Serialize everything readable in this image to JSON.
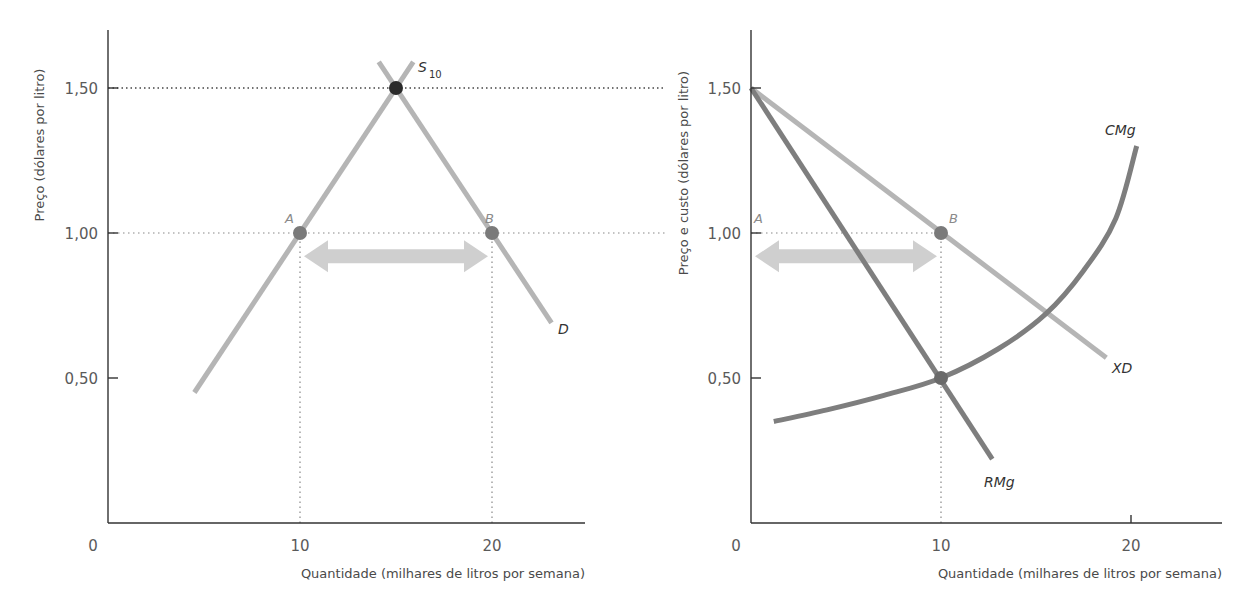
{
  "chart_data": [
    {
      "type": "line",
      "title": "",
      "xlabel": "Quantidade (milhares de litros por semana)",
      "ylabel": "Preço (dólares por litro)",
      "xlim": [
        0,
        25
      ],
      "ylim": [
        0,
        1.7
      ],
      "x_ticks": [
        {
          "value": 0,
          "label": "0"
        },
        {
          "value": 10,
          "label": "10"
        },
        {
          "value": 20,
          "label": "20"
        }
      ],
      "y_ticks": [
        {
          "value": 0.5,
          "label": "0,50"
        },
        {
          "value": 1.0,
          "label": "1,00"
        },
        {
          "value": 1.5,
          "label": "1,50"
        }
      ],
      "grid": false,
      "series": [
        {
          "name": "S10",
          "label_main": "S",
          "label_sub": "10",
          "color": "#b5b5b5",
          "points": [
            [
              4.5,
              0.45
            ],
            [
              15.9,
              1.59
            ]
          ]
        },
        {
          "name": "D",
          "label_main": "D",
          "label_sub": "",
          "color": "#b5b5b5",
          "points": [
            [
              14.1,
              1.59
            ],
            [
              23.1,
              0.69
            ]
          ]
        }
      ],
      "points": [
        {
          "name": "equilibrium",
          "label": "",
          "x": 15,
          "y": 1.5,
          "color": "#2a2a2a"
        },
        {
          "name": "A",
          "label": "A",
          "x": 10,
          "y": 1.0,
          "color": "#7a7a7a"
        },
        {
          "name": "B",
          "label": "B",
          "x": 20,
          "y": 1.0,
          "color": "#7a7a7a"
        }
      ],
      "reference_lines": [
        {
          "type": "horizontal",
          "y": 1.5,
          "from_x": 0,
          "to_x": 29
        },
        {
          "type": "horizontal",
          "y": 1.0,
          "from_x": 0,
          "to_x": 29
        },
        {
          "type": "vertical",
          "x": 10,
          "from_y": 0,
          "to_y": 1.0
        },
        {
          "type": "vertical",
          "x": 20,
          "from_y": 0,
          "to_y": 1.0
        }
      ],
      "annotations": [
        {
          "type": "double-arrow",
          "from": [
            10,
            0.93
          ],
          "to": [
            20,
            0.93
          ],
          "meaning": "excess supply between A and B"
        }
      ]
    },
    {
      "type": "line",
      "title": "",
      "xlabel": "Quantidade (milhares de litros por semana)",
      "ylabel": "Preço e custo (dólares por litro)",
      "xlim": [
        0,
        24.5
      ],
      "ylim": [
        0,
        1.7
      ],
      "x_ticks": [
        {
          "value": 0,
          "label": "0"
        },
        {
          "value": 10,
          "label": "10"
        },
        {
          "value": 20,
          "label": "20"
        }
      ],
      "y_ticks": [
        {
          "value": 0.5,
          "label": "0,50"
        },
        {
          "value": 1.0,
          "label": "1,00"
        },
        {
          "value": 1.5,
          "label": "1,50"
        }
      ],
      "grid": false,
      "series": [
        {
          "name": "XD",
          "label_main": "XD",
          "color": "#b5b5b5",
          "points": [
            [
              0,
              1.5
            ],
            [
              18.7,
              0.57
            ]
          ]
        },
        {
          "name": "RMg",
          "label_main": "RMg",
          "color": "#7e7e7e",
          "points": [
            [
              0,
              1.5
            ],
            [
              12.7,
              0.22
            ]
          ]
        },
        {
          "name": "CMg",
          "label_main": "CMg",
          "color": "#7e7e7e",
          "points": [
            [
              1.2,
              0.35
            ],
            [
              4,
              0.39
            ],
            [
              7,
              0.44
            ],
            [
              10,
              0.5
            ],
            [
              13,
              0.6
            ],
            [
              15.5,
              0.72
            ],
            [
              17.5,
              0.87
            ],
            [
              19.2,
              1.05
            ],
            [
              20.3,
              1.3
            ]
          ]
        }
      ],
      "points": [
        {
          "name": "A",
          "label": "A",
          "x": 0,
          "y": 1.0,
          "color": "none"
        },
        {
          "name": "B",
          "label": "B",
          "x": 10,
          "y": 1.0,
          "color": "#7a7a7a"
        },
        {
          "name": "RMg=CMg",
          "label": "",
          "x": 10,
          "y": 0.5,
          "color": "#6a6a6a"
        }
      ],
      "reference_lines": [
        {
          "type": "horizontal",
          "y": 1.0,
          "from_x": 0,
          "to_x": 10
        },
        {
          "type": "vertical",
          "x": 10,
          "from_y": 0,
          "to_y": 1.0
        }
      ],
      "annotations": [
        {
          "type": "double-arrow",
          "from": [
            0,
            0.93
          ],
          "to": [
            10,
            0.93
          ],
          "meaning": "quantity restriction gap A to B"
        }
      ]
    }
  ]
}
